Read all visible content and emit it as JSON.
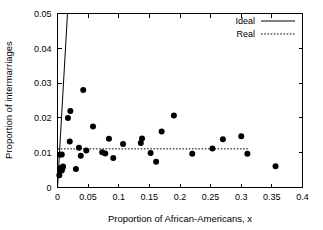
{
  "chart_data": {
    "type": "scatter",
    "title": "",
    "xlabel": "Proportion of African-Americans, x",
    "ylabel": "Proportion of intermarriages",
    "xlim": [
      0,
      0.4
    ],
    "ylim": [
      0,
      0.05
    ],
    "xticks": [
      0,
      0.05,
      0.1,
      0.15,
      0.2,
      0.25,
      0.3,
      0.35,
      0.4
    ],
    "xtick_labels": [
      "0",
      "0.05",
      "0.1",
      "0.15",
      "0.2",
      "0.25",
      "0.3",
      "0.35",
      "0.4"
    ],
    "yticks": [
      0,
      0.01,
      0.02,
      0.03,
      0.04,
      0.05
    ],
    "ytick_labels": [
      "0",
      "0.01",
      "0.02",
      "0.03",
      "0.04",
      "0.05"
    ],
    "grid": false,
    "legend_position": "top-right",
    "marker_color": "#000000",
    "marker_size": 3.0,
    "series": [
      {
        "name": "Data",
        "type": "scatter",
        "legend": false,
        "points": [
          [
            0.003,
            0.0035
          ],
          [
            0.004,
            0.0094
          ],
          [
            0.005,
            0.0052
          ],
          [
            0.006,
            0.005
          ],
          [
            0.006,
            0.0057
          ],
          [
            0.007,
            0.0049
          ],
          [
            0.007,
            0.0095
          ],
          [
            0.008,
            0.0055
          ],
          [
            0.009,
            0.006
          ],
          [
            0.017,
            0.02
          ],
          [
            0.02,
            0.0132
          ],
          [
            0.021,
            0.022
          ],
          [
            0.03,
            0.0053
          ],
          [
            0.035,
            0.0114
          ],
          [
            0.038,
            0.0091
          ],
          [
            0.042,
            0.028
          ],
          [
            0.047,
            0.0106
          ],
          [
            0.058,
            0.0175
          ],
          [
            0.073,
            0.0101
          ],
          [
            0.078,
            0.0098
          ],
          [
            0.084,
            0.014
          ],
          [
            0.091,
            0.0085
          ],
          [
            0.107,
            0.0125
          ],
          [
            0.136,
            0.0128
          ],
          [
            0.138,
            0.0141
          ],
          [
            0.152,
            0.0099
          ],
          [
            0.161,
            0.0074
          ],
          [
            0.17,
            0.0161
          ],
          [
            0.19,
            0.0207
          ],
          [
            0.22,
            0.0097
          ],
          [
            0.253,
            0.0112
          ],
          [
            0.27,
            0.0139
          ],
          [
            0.3,
            0.0147
          ],
          [
            0.31,
            0.0097
          ],
          [
            0.356,
            0.0061
          ]
        ]
      },
      {
        "name": "Ideal",
        "type": "line",
        "legend": true,
        "style": "solid",
        "points": [
          [
            0.0,
            0.0
          ],
          [
            0.0163,
            0.05
          ]
        ]
      },
      {
        "name": "Real",
        "type": "line",
        "legend": true,
        "style": "dotted",
        "value": 0.0111,
        "points": [
          [
            0.0,
            0.0111
          ],
          [
            0.311,
            0.0111
          ]
        ]
      }
    ],
    "legend_entries": [
      {
        "label": "Ideal",
        "style": "solid"
      },
      {
        "label": "Real",
        "style": "dotted"
      }
    ]
  }
}
